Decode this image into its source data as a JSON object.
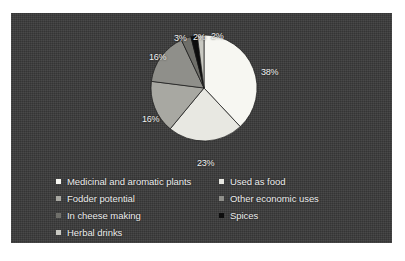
{
  "chart_data": {
    "type": "pie",
    "title": "",
    "subtitle": "",
    "xlabel": "",
    "ylabel": "",
    "legend_position": "bottom",
    "grid": false,
    "start_angle_deg": 0,
    "direction": "clockwise",
    "categories": [
      "Medicinal and aromatic plants",
      "Used as food",
      "Fodder potential",
      "Other economic uses",
      "In cheese making",
      "Spices",
      "Herbal drinks"
    ],
    "values": [
      38,
      23,
      16,
      16,
      3,
      2,
      2
    ],
    "value_labels": [
      "38%",
      "23%",
      "16%",
      "16%",
      "3%",
      "2%",
      "2%"
    ],
    "colors": [
      "#f7f7f2",
      "#e8e8e2",
      "#a8a8a2",
      "#8f8f8a",
      "#6f6f6a",
      "#0d0d0d",
      "#c9c9c2"
    ],
    "slices": [
      {
        "label": "Medicinal and aromatic plants",
        "value": 38,
        "display": "38%",
        "color": "#f7f7f2"
      },
      {
        "label": "Used as food",
        "value": 23,
        "display": "23%",
        "color": "#e8e8e2"
      },
      {
        "label": "Fodder potential",
        "value": 16,
        "display": "16%",
        "color": "#a8a8a2"
      },
      {
        "label": "Other economic uses",
        "value": 16,
        "display": "16%",
        "color": "#8f8f8a"
      },
      {
        "label": "In cheese making",
        "value": 3,
        "display": "3%",
        "color": "#6f6f6a"
      },
      {
        "label": "Spices",
        "value": 2,
        "display": "2%",
        "color": "#0d0d0d"
      },
      {
        "label": "Herbal drinks",
        "value": 2,
        "display": "2%",
        "color": "#c9c9c2"
      }
    ],
    "total": 100
  },
  "labels": {
    "pct_38": "38%",
    "pct_23": "23%",
    "pct_16a": "16%",
    "pct_16b": "16%",
    "pct_3": "3%",
    "pct_2a": "2%",
    "pct_2b": "2%"
  },
  "legend": {
    "left_column": [
      {
        "label": "Medicinal and aromatic plants",
        "color": "#f7f7f2"
      },
      {
        "label": "Fodder potential",
        "color": "#a8a8a2"
      },
      {
        "label": "In cheese making",
        "color": "#6f6f6a"
      },
      {
        "label": "Herbal drinks",
        "color": "#c9c9c2"
      }
    ],
    "right_column": [
      {
        "label": "Used as food",
        "color": "#e8e8e2"
      },
      {
        "label": "Other economic uses",
        "color": "#8f8f8a"
      },
      {
        "label": "Spices",
        "color": "#0d0d0d"
      }
    ]
  },
  "panel": {
    "background_color": "#3a3a3a",
    "page_background": "#ffffff"
  }
}
